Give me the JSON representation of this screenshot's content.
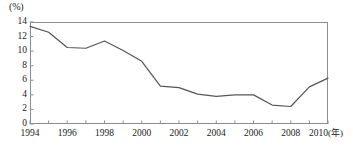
{
  "chart_data": {
    "type": "line",
    "title": "",
    "subtitle": "",
    "xlabel": "年",
    "ylabel": "(%)",
    "y_unit_label": "(%)",
    "x_unit_label": "(年)",
    "ylim": [
      0,
      14
    ],
    "xlim": [
      1994,
      2010
    ],
    "grid": false,
    "legend": false,
    "legend_position": "none",
    "y_ticks": [
      0,
      2,
      4,
      6,
      8,
      10,
      12,
      14
    ],
    "y_tick_labels": [
      "0",
      "2",
      "4",
      "6",
      "8",
      "10",
      "12",
      "14"
    ],
    "x_ticks": [
      1994,
      1995,
      1996,
      1997,
      1998,
      1999,
      2000,
      2001,
      2002,
      2003,
      2004,
      2005,
      2006,
      2007,
      2008,
      2009,
      2010
    ],
    "x_tick_labels_shown": [
      "1994",
      "1996",
      "1998",
      "2000",
      "2002",
      "2004",
      "2006",
      "2008",
      "2010"
    ],
    "x": [
      1994,
      1995,
      1996,
      1997,
      1998,
      1999,
      2000,
      2001,
      2002,
      2003,
      2004,
      2005,
      2006,
      2007,
      2008,
      2009,
      2010
    ],
    "values": [
      13.4,
      12.6,
      10.5,
      10.4,
      11.4,
      10.1,
      8.6,
      5.2,
      5.0,
      4.1,
      3.8,
      4.0,
      4.0,
      2.6,
      2.4,
      5.1,
      6.3
    ],
    "series": [
      {
        "name": "series-1",
        "color": "#555555",
        "values": [
          13.4,
          12.6,
          10.5,
          10.4,
          11.4,
          10.1,
          8.6,
          5.2,
          5.0,
          4.1,
          3.8,
          4.0,
          4.0,
          2.6,
          2.4,
          5.1,
          6.3
        ]
      }
    ],
    "line_color": "#555555",
    "frame_color": "#8d8d8d",
    "background_color": "#ffffff"
  }
}
